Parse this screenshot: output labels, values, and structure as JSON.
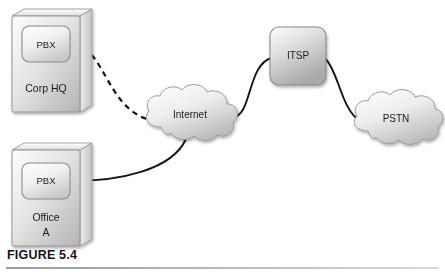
{
  "figure": {
    "caption": "FIGURE 5.4",
    "background_color": "#ffffff",
    "rule_color": "#9a9a9a"
  },
  "diagram": {
    "type": "network-topology",
    "nodes": [
      {
        "id": "corp-hq",
        "shape": "3d-box",
        "site_label": "Corp HQ",
        "device_label": "PBX",
        "x": 12,
        "y": 16,
        "width": 68,
        "height": 96
      },
      {
        "id": "office-a",
        "shape": "3d-box",
        "site_label_line1": "Office",
        "site_label_line2": "A",
        "device_label": "PBX",
        "x": 12,
        "y": 150,
        "width": 68,
        "height": 96
      },
      {
        "id": "internet",
        "shape": "cloud",
        "label": "Internet",
        "cx": 192,
        "cy": 114
      },
      {
        "id": "itsp",
        "shape": "rounded-box",
        "label": "ITSP",
        "x": 270,
        "y": 27,
        "width": 56,
        "height": 58
      },
      {
        "id": "pstn",
        "shape": "cloud",
        "label": "PSTN",
        "cx": 396,
        "cy": 118
      }
    ],
    "links": [
      {
        "id": "corp-hq-to-internet",
        "from": "corp-hq",
        "to": "internet",
        "style": "dashed"
      },
      {
        "id": "office-a-to-internet",
        "from": "office-a",
        "to": "internet",
        "style": "solid"
      },
      {
        "id": "internet-to-itsp",
        "from": "internet",
        "to": "itsp",
        "style": "solid"
      },
      {
        "id": "itsp-to-pstn",
        "from": "itsp",
        "to": "pstn",
        "style": "solid"
      }
    ],
    "colors": {
      "line": "#141414",
      "box_fill_light": "#fbfbfb",
      "box_fill_dark": "#b8b8b8",
      "box_stroke": "#8c8c8c",
      "cloud_fill_light": "#fdfdfd",
      "cloud_fill_dark": "#bcbcbc",
      "cloud_stroke": "#9a9a9a",
      "text": "#1a1a1a"
    }
  }
}
